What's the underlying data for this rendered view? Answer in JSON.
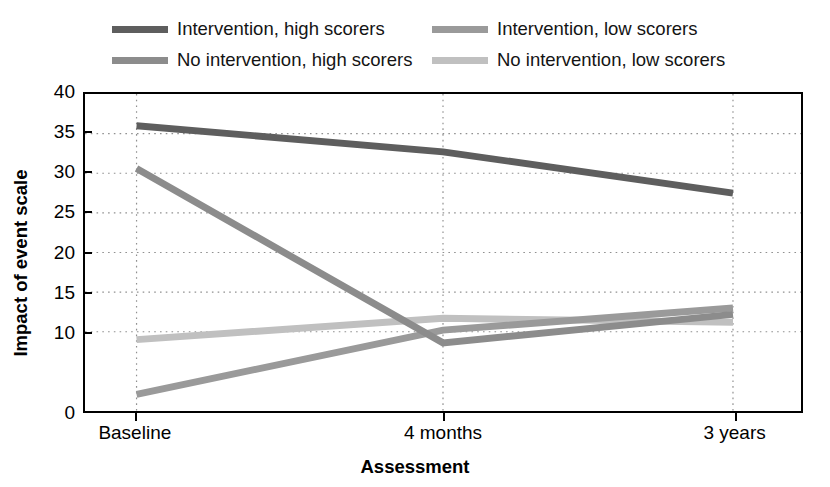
{
  "chart_data": {
    "type": "line",
    "title": "",
    "xlabel": "Assessment",
    "ylabel": "Impact of event scale",
    "categories": [
      "Baseline",
      "4 months",
      "3 years"
    ],
    "x": [
      0,
      1,
      2
    ],
    "ylim": [
      0,
      40
    ],
    "yticks": [
      0,
      10,
      15,
      20,
      25,
      30,
      35,
      40
    ],
    "ytick_labels": [
      "0",
      "10",
      "15",
      "20",
      "25",
      "30",
      "35",
      "40"
    ],
    "gridlines": [
      10,
      15,
      20,
      25,
      30,
      35
    ],
    "grid": "dotted-both",
    "legend_position": "above-plot",
    "series": [
      {
        "name": "Intervention, high scorers",
        "color": "#5e5e5e",
        "values": [
          36.0,
          32.7,
          27.5
        ]
      },
      {
        "name": "Intervention, low scorers",
        "color": "#9a9a9a",
        "values": [
          2.1,
          10.2,
          13.0
        ]
      },
      {
        "name": "No intervention, high scorers",
        "color": "#8c8c8c",
        "values": [
          30.6,
          8.6,
          12.2
        ]
      },
      {
        "name": "No intervention, low scorers",
        "color": "#c0c0c0",
        "values": [
          9.0,
          11.7,
          11.2
        ]
      }
    ]
  },
  "legend": {
    "items": [
      {
        "label": "Intervention, high scorers",
        "color": "#5e5e5e",
        "swatch": "line-swatch"
      },
      {
        "label": "Intervention, low scorers",
        "color": "#9a9a9a",
        "swatch": "line-swatch"
      },
      {
        "label": "No intervention, high scorers",
        "color": "#8c8c8c",
        "swatch": "line-swatch"
      },
      {
        "label": "No intervention, low scorers",
        "color": "#c0c0c0",
        "swatch": "line-swatch"
      }
    ]
  },
  "axes": {
    "y_title": "Impact of event scale",
    "x_title": "Assessment",
    "y_labels": [
      "40",
      "35",
      "30",
      "25",
      "20",
      "15",
      "10",
      "0"
    ],
    "x_labels": [
      "Baseline",
      "4 months",
      "3 years"
    ]
  }
}
